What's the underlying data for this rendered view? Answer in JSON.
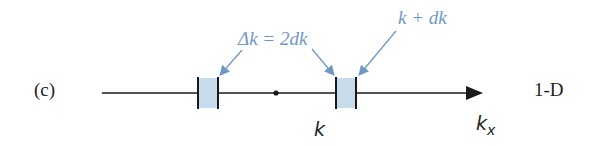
{
  "panel_label": "(c)",
  "dimension_label": "1-D",
  "annotations": {
    "delta_k": "Δk = 2dk",
    "k_plus_dk": "k + dk"
  },
  "axis": {
    "point_label": "k",
    "axis_label_base": "k",
    "axis_label_sub": "x"
  },
  "colors": {
    "axis": "#1a1a1a",
    "box_fill": "#c6dced",
    "annotation": "#6f98c8",
    "text": "#222222"
  }
}
